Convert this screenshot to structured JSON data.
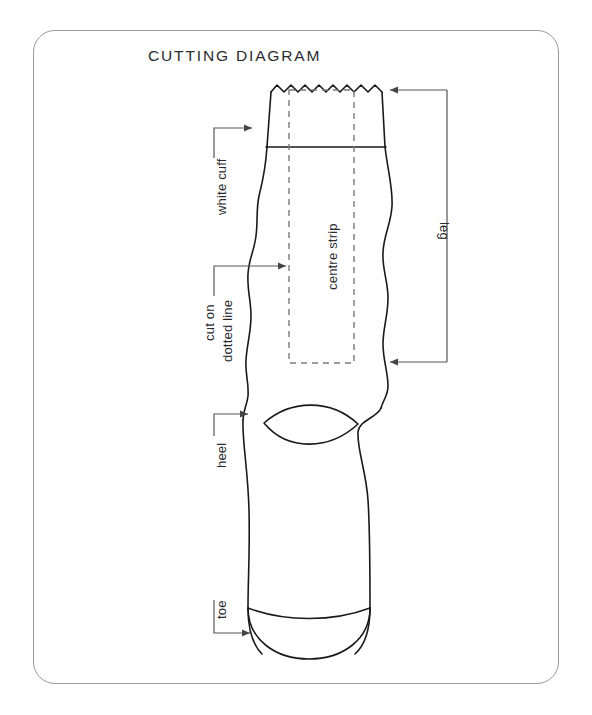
{
  "document": {
    "title": "CUTTING DIAGRAM"
  },
  "card": {
    "border_color": "#9a9a9e",
    "background": "#ffffff",
    "corner_radius_px": 22
  },
  "labels": {
    "white_cuff": "white cuff",
    "cut_on": "cut on",
    "dotted_line": "dotted line",
    "heel": "heel",
    "toe": "toe",
    "centre_strip": "centre strip",
    "leg": "leg"
  },
  "diagram": {
    "name": "sock-cutting-diagram",
    "outline_color": "#1a1a1a",
    "dashed_color": "#7a7a7e",
    "leader_color": "#555558",
    "parts": [
      "zigzag-top-edge",
      "cuff-band-line",
      "leg-outline",
      "centre-strip-dashed-rect",
      "heel-lens-shape",
      "toe-seam-line",
      "toe-rounded-end"
    ]
  },
  "annotations": [
    {
      "id": "white-cuff",
      "label": "white cuff",
      "leader": "up-then-right-arrow"
    },
    {
      "id": "cut-on-dotted-line",
      "label": "cut on dotted line",
      "leader": "up-then-right-arrow"
    },
    {
      "id": "heel",
      "label": "heel",
      "leader": "up-then-right-arrow"
    },
    {
      "id": "toe",
      "label": "toe",
      "leader": "down-then-right-arrow"
    },
    {
      "id": "centre-strip",
      "label": "centre strip",
      "leader": "none"
    },
    {
      "id": "leg",
      "label": "leg",
      "leader": "vertical-bracket-two-arrows"
    }
  ]
}
